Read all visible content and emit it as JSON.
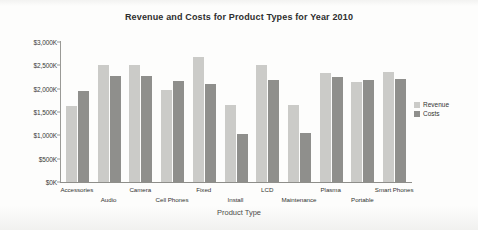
{
  "chart_data": {
    "type": "bar",
    "title": "Revenue and Costs for Product Types for Year 2010",
    "xlabel": "Product Type",
    "ylabel": "",
    "ylim": [
      0,
      3000
    ],
    "grid": false,
    "legend_position": "right",
    "y_tick_labels": [
      "$3,000K",
      "$2,500K",
      "$2,000K",
      "$1,500K",
      "$1,000K",
      "$500K",
      "$0K"
    ],
    "y_tick_values": [
      3000,
      2500,
      2000,
      1500,
      1000,
      500,
      0
    ],
    "categories": [
      "Accessories",
      "Audio",
      "Camera",
      "Cell Phones",
      "Fixed",
      "Install",
      "LCD",
      "Maintenance",
      "Plasma",
      "Portable",
      "Smart Phones"
    ],
    "series": [
      {
        "name": "Revenue",
        "color": "#cbcbc8",
        "values": [
          1620,
          2500,
          2500,
          1980,
          2680,
          1660,
          2510,
          1650,
          2330,
          2140,
          2350
        ]
      },
      {
        "name": "Costs",
        "color": "#8f8f8c",
        "values": [
          1950,
          2280,
          2270,
          2170,
          2100,
          1020,
          2190,
          1050,
          2250,
          2180,
          2200
        ]
      }
    ]
  },
  "legend": {
    "items": [
      {
        "label": "Revenue",
        "color": "#cbcbc8"
      },
      {
        "label": "Costs",
        "color": "#8f8f8c"
      }
    ]
  }
}
